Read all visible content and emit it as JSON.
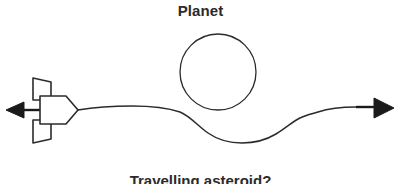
{
  "figure": {
    "kind": "gravitational-slingshot-diagram",
    "width": 401,
    "height": 184,
    "background_color": "#ffffff",
    "stroke_color": "#2b2b2b",
    "title": "Planet",
    "caption": "Travelling asteroid?"
  },
  "labels": {
    "planet_title": "Planet",
    "bottom_caption": "Travelling asteroid?"
  },
  "elements": {
    "planet": {
      "name": "Planet",
      "shape": "circle",
      "center_x": 218,
      "center_y": 72,
      "radius": 38,
      "fill": "none",
      "stroke": "#2b2b2b",
      "stroke_width": 1.3
    },
    "spacecraft": {
      "name": "Spacecraft",
      "nose_direction": "right",
      "body_x": 38,
      "body_y": 96,
      "body_width": 28,
      "body_height": 27,
      "fins": 2,
      "stroke": "#2b2b2b",
      "stroke_width": 1.6
    },
    "left_arrow": {
      "name": "Velocity arrow (left)",
      "direction": "left",
      "y": 110,
      "tail_x": 40,
      "head_x": 6,
      "stroke": "#1a1a1a",
      "stroke_width": 2.4
    },
    "right_arrow": {
      "name": "Trajectory arrow (right)",
      "direction": "right",
      "y": 110,
      "head_x": 394,
      "stroke": "#1a1a1a",
      "stroke_width": 2.4
    },
    "trajectory": {
      "name": "Asteroid trajectory",
      "start_x": 78,
      "start_y": 110,
      "min_y": 110,
      "max_y": 143,
      "end_x": 372,
      "end_y": 110,
      "stroke": "#2b2b2b",
      "stroke_width": 1.5,
      "description": "Path approaches from the left, dips downward beneath the planet, then rises back and exits to the right."
    }
  },
  "colors": {
    "ink": "#2b2b2b",
    "arrow_fill": "#1a1a1a",
    "background": "#ffffff"
  }
}
